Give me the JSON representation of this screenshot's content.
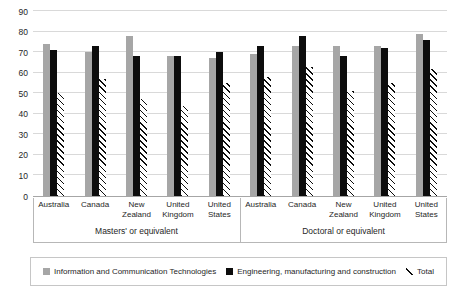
{
  "chart_data": {
    "type": "bar",
    "title": "",
    "xlabel": "",
    "ylabel": "",
    "ylim": [
      0,
      90
    ],
    "y_ticks": [
      0,
      10,
      20,
      30,
      40,
      50,
      60,
      70,
      80,
      90
    ],
    "grid": "horizontal",
    "legend_position": "bottom-boxed",
    "series": [
      {
        "key": "ict",
        "name": "Information and Communication Technologies",
        "style": "solid-gray",
        "color": "#a6a6a6"
      },
      {
        "key": "engineering",
        "name": "Engineering, manufacturing and construction",
        "style": "solid-black",
        "color": "#0d0d0d"
      },
      {
        "key": "total",
        "name": "Total",
        "style": "diagonal-hatch",
        "color": "#0d0d0d"
      }
    ],
    "groups": [
      {
        "label": "Masters' or equivalent",
        "categories": [
          "Australia",
          "Canada",
          "New Zealand",
          "United Kingdom",
          "United States"
        ],
        "values": {
          "ict": [
            74,
            70,
            78,
            68,
            67
          ],
          "engineering": [
            71,
            73,
            68,
            68,
            70
          ],
          "total": [
            50,
            57,
            47,
            44,
            55
          ]
        }
      },
      {
        "label": "Doctoral or equivalent",
        "categories": [
          "Australia",
          "Canada",
          "New Zealand",
          "United Kingdom",
          "United States"
        ],
        "values": {
          "ict": [
            69,
            73,
            73,
            73,
            79
          ],
          "engineering": [
            73,
            78,
            68,
            72,
            76
          ],
          "total": [
            58,
            63,
            51,
            55,
            62
          ]
        }
      }
    ],
    "colors": {
      "gridline": "#d9d9d9",
      "axis": "#a6a6a6",
      "text": "#262626",
      "background": "#ffffff"
    }
  }
}
